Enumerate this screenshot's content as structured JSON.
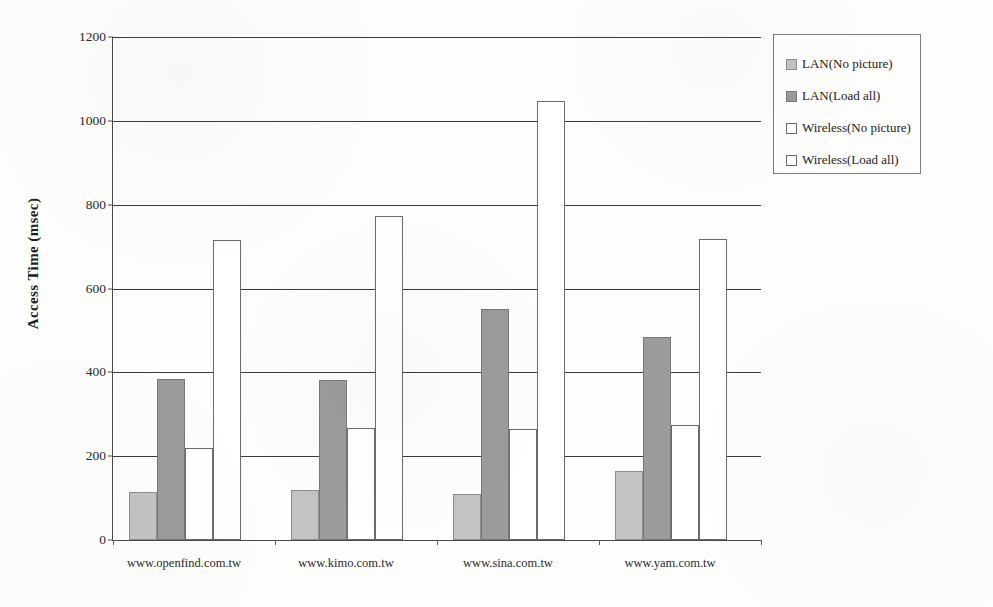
{
  "chart_data": {
    "type": "bar",
    "title": "",
    "xlabel": "",
    "ylabel": "Access Time (msec)",
    "ylim": [
      0,
      1200
    ],
    "ytick_labels": [
      "0",
      "200",
      "400",
      "600",
      "800",
      "1000",
      "1200"
    ],
    "yticks": [
      0,
      200,
      400,
      600,
      800,
      1000,
      1200
    ],
    "grid": true,
    "legend_position": "right",
    "categories": [
      "www.openfind.com.tw",
      "www.kimo.com.tw",
      "www.sina.com.tw",
      "www.yam.com.tw"
    ],
    "series": [
      {
        "name": "LAN(No picture)",
        "color": "#c3c3c3",
        "values": [
          115,
          120,
          110,
          165
        ]
      },
      {
        "name": "LAN(Load all)",
        "color": "#9b9b9b",
        "values": [
          385,
          382,
          550,
          485
        ]
      },
      {
        "name": "Wireless(No picture)",
        "color": "#ffffff",
        "values": [
          220,
          268,
          265,
          275
        ]
      },
      {
        "name": "Wireless(Load all)",
        "color": "#ffffff",
        "values": [
          715,
          772,
          1048,
          718
        ]
      }
    ]
  },
  "legend": {
    "items": [
      {
        "label": "LAN(No picture)"
      },
      {
        "label": "LAN(Load all)"
      },
      {
        "label": "Wireless(No picture)"
      },
      {
        "label": "Wireless(Load all)"
      }
    ]
  }
}
